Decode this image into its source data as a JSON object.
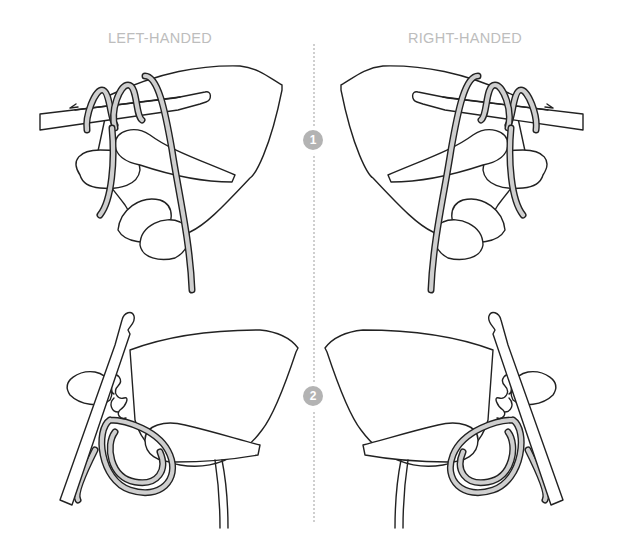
{
  "columns": {
    "left_label": "LEFT-HANDED",
    "right_label": "RIGHT-HANDED"
  },
  "steps": [
    {
      "number": "1"
    },
    {
      "number": "2"
    }
  ],
  "illustrations": [
    {
      "column": "left",
      "step": "1",
      "subject": "hand with yarn wrapped around fingers, crochet hook held along index finger"
    },
    {
      "column": "right",
      "step": "1",
      "subject": "hand with yarn wrapped around fingers, crochet hook held along index finger"
    },
    {
      "column": "left",
      "step": "2",
      "subject": "hand holding yarn loops with crochet hook and chain stitches"
    },
    {
      "column": "right",
      "step": "2",
      "subject": "hand holding yarn loops with crochet hook and chain stitches"
    }
  ],
  "colors": {
    "label": "#bdbdbd",
    "badge": "#b3b3b3",
    "divider": "#cfcfcf",
    "yarn_fill": "#cfcfcf",
    "ink": "#222222"
  }
}
